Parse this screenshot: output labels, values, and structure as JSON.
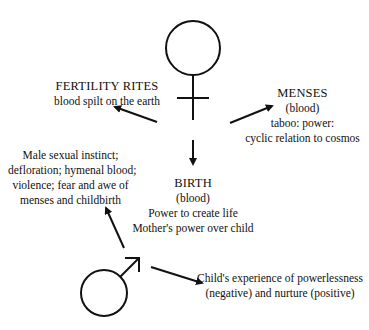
{
  "diagram": {
    "symbols": {
      "female": "female-symbol",
      "male": "male-symbol"
    },
    "nodes": {
      "fertility": {
        "title": "FERTILITY RITES",
        "lines": [
          "blood spilt on the earth"
        ]
      },
      "menses": {
        "title": "MENSES",
        "lines": [
          "(blood)",
          "taboo: power:",
          "cyclic relation to cosmos"
        ]
      },
      "birth": {
        "title": "BIRTH",
        "lines": [
          "(blood)",
          "Power to create life",
          "Mother's power over child"
        ]
      },
      "male_instinct": {
        "lines": [
          "Male sexual instinct;",
          "defloration; hymenal blood;",
          "violence; fear and awe of",
          "menses and childbirth"
        ]
      },
      "child": {
        "lines": [
          "Child's experience of powerlessness",
          "(negative) and nurture (positive)"
        ]
      }
    },
    "edges": [
      {
        "from": "female",
        "to": "fertility"
      },
      {
        "from": "female",
        "to": "menses"
      },
      {
        "from": "female",
        "to": "birth"
      },
      {
        "from": "male",
        "to": "male_instinct"
      },
      {
        "from": "male",
        "to": "child"
      }
    ],
    "colors": {
      "ink": "#111111",
      "background": "#ffffff"
    }
  }
}
